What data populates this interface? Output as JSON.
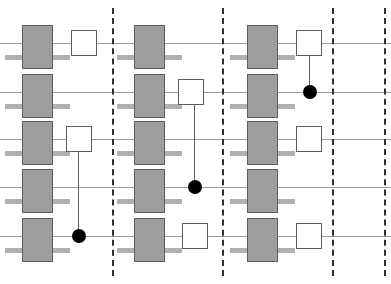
{
  "diagram": {
    "type": "quantum-circuit",
    "canvas": {
      "width": 391,
      "height": 284,
      "background": "#ffffff"
    },
    "colors": {
      "wire": "#9a9a9a",
      "barrier": "#2e2e2e",
      "gate_fill": "#9e9e9e",
      "gate_stroke": "#5d5d5d",
      "gate_lead": "#b0b0b0",
      "box_fill": "#ffffff",
      "control_dot": "#000000"
    },
    "wires": [
      {
        "index": 1,
        "y": 43
      },
      {
        "index": 2,
        "y": 92
      },
      {
        "index": 3,
        "y": 139
      },
      {
        "index": 4,
        "y": 187
      },
      {
        "index": 5,
        "y": 236
      }
    ],
    "barriers": [
      {
        "index": 1,
        "x": 112
      },
      {
        "index": 2,
        "x": 222
      },
      {
        "index": 3,
        "x": 332
      },
      {
        "index": 4,
        "x": 384
      }
    ],
    "blocks": [
      {
        "index": 1,
        "label": "block-1",
        "gray_gate_x": 22,
        "gray_gates": [
          1,
          2,
          3,
          4,
          5
        ],
        "boxes": [
          {
            "wire": 1,
            "x": 71
          },
          {
            "wire": 3,
            "x": 66
          }
        ],
        "controls": [
          {
            "box_wire": 3,
            "dot_wire": 5,
            "x": 78
          }
        ]
      },
      {
        "index": 2,
        "label": "block-2",
        "gray_gate_x": 134,
        "gray_gates": [
          1,
          2,
          3,
          4,
          5
        ],
        "boxes": [
          {
            "wire": 2,
            "x": 178
          },
          {
            "wire": 5,
            "x": 182
          }
        ],
        "controls": [
          {
            "box_wire": 2,
            "dot_wire": 4,
            "x": 194
          }
        ]
      },
      {
        "index": 3,
        "label": "block-3",
        "gray_gate_x": 247,
        "gray_gates": [
          1,
          2,
          3,
          4,
          5
        ],
        "boxes": [
          {
            "wire": 1,
            "x": 296
          },
          {
            "wire": 3,
            "x": 296
          },
          {
            "wire": 5,
            "x": 296
          }
        ],
        "controls": [
          {
            "box_wire": 1,
            "dot_wire": 2,
            "x": 309
          }
        ]
      }
    ],
    "geometry": {
      "gray_gate_width": 31,
      "gray_gate_height": 44,
      "gate_lead_width": 17,
      "gate_lead_offset_y": 12,
      "white_box_size": 26,
      "control_dot_radius": 7
    }
  }
}
